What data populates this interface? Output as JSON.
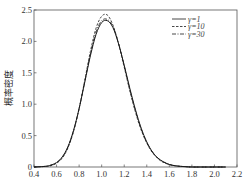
{
  "chart_data": {
    "type": "line",
    "title": "",
    "xlabel": "",
    "ylabel": "概率密度",
    "xlim": [
      0.4,
      2.2
    ],
    "ylim": [
      0,
      2.5
    ],
    "xticks": [
      0.4,
      0.6,
      0.8,
      1.0,
      1.2,
      1.4,
      1.6,
      1.8,
      2.0,
      2.2
    ],
    "xtick_labels": [
      "0.4",
      "0.6",
      "0.8",
      "1.0",
      "1.2",
      "1.4",
      "1.6",
      "1.8",
      "2.0",
      "2.2"
    ],
    "yticks": [
      0,
      0.5,
      1.0,
      1.5,
      2.0,
      2.5
    ],
    "ytick_labels": [
      "0",
      "0.5",
      "1.0",
      "1.5",
      "2.0",
      "2.5"
    ],
    "grid": false,
    "legend_position": "upper right",
    "x": [
      0.5,
      0.55,
      0.6,
      0.65,
      0.7,
      0.75,
      0.8,
      0.85,
      0.9,
      0.95,
      1.0,
      1.05,
      1.1,
      1.15,
      1.2,
      1.25,
      1.3,
      1.35,
      1.4,
      1.45,
      1.5,
      1.55,
      1.6,
      1.65,
      1.7,
      1.75,
      1.8,
      1.9,
      2.0,
      2.1
    ],
    "series": [
      {
        "name": "γ=1",
        "style": "solid",
        "values": [
          0.01,
          0.03,
          0.07,
          0.16,
          0.32,
          0.58,
          0.93,
          1.35,
          1.77,
          2.11,
          2.3,
          2.33,
          2.22,
          1.96,
          1.62,
          1.25,
          0.91,
          0.62,
          0.4,
          0.24,
          0.14,
          0.08,
          0.04,
          0.02,
          0.01,
          0.005,
          0.0,
          0.0,
          0.0,
          0.0
        ]
      },
      {
        "name": "γ=10",
        "style": "dashed",
        "values": [
          0.01,
          0.02,
          0.06,
          0.14,
          0.3,
          0.56,
          0.93,
          1.38,
          1.84,
          2.21,
          2.4,
          2.42,
          2.26,
          1.96,
          1.59,
          1.21,
          0.87,
          0.59,
          0.38,
          0.23,
          0.13,
          0.07,
          0.04,
          0.02,
          0.01,
          0.005,
          0.0,
          0.0,
          0.0,
          0.0
        ]
      },
      {
        "name": "γ=30",
        "style": "dashdot",
        "values": [
          0.01,
          0.03,
          0.07,
          0.15,
          0.31,
          0.57,
          0.93,
          1.36,
          1.8,
          2.15,
          2.33,
          2.35,
          2.24,
          1.97,
          1.61,
          1.23,
          0.89,
          0.61,
          0.39,
          0.24,
          0.14,
          0.08,
          0.04,
          0.02,
          0.01,
          0.005,
          0.0,
          0.0,
          0.0,
          0.0
        ]
      }
    ]
  },
  "legend": {
    "items": [
      {
        "label": "γ=1",
        "style": "solid"
      },
      {
        "label": "γ=10",
        "style": "dashed"
      },
      {
        "label": "γ=30",
        "style": "dashdot"
      }
    ]
  },
  "axis": {
    "ylabel": "概率密度"
  },
  "colors": {
    "axis": "#555555",
    "line": "#1a1a1a",
    "text": "#333333"
  }
}
